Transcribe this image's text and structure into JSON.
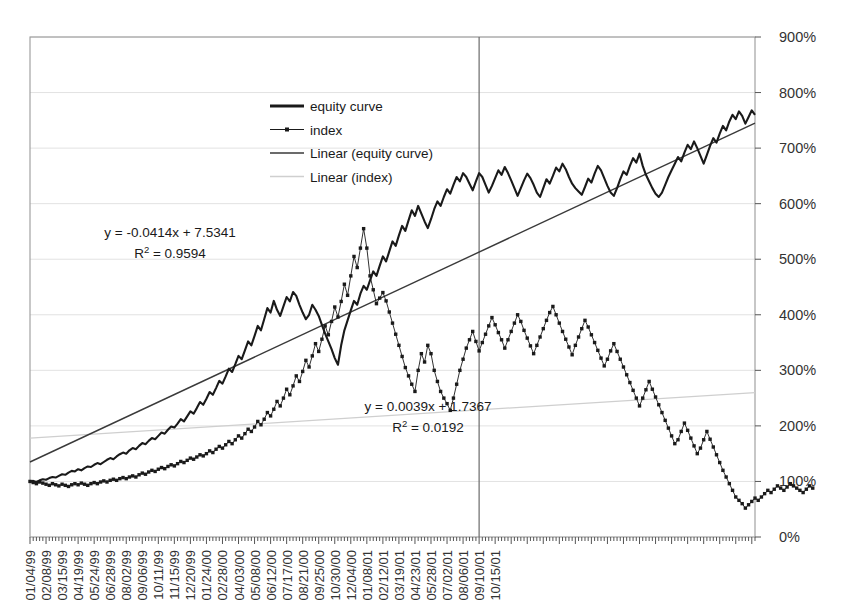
{
  "chart_data": {
    "type": "line",
    "title": "",
    "subtitle": "",
    "xlabel": "",
    "ylabel": "",
    "ylim": [
      0,
      900
    ],
    "y_tick_step": 100,
    "y_tick_labels": [
      "0%",
      "100%",
      "200%",
      "300%",
      "400%",
      "500%",
      "600%",
      "700%",
      "800%",
      "900%"
    ],
    "y_axis_position": "right",
    "grid": true,
    "grid_axis": "y",
    "legend_position": "top-center-left",
    "x_tick_labels": [
      "01/04/99",
      "02/08/99",
      "03/15/99",
      "04/19/99",
      "05/24/99",
      "06/28/99",
      "08/02/99",
      "09/06/99",
      "10/11/99",
      "11/15/99",
      "12/20/99",
      "01/24/00",
      "02/28/00",
      "04/03/00",
      "05/08/00",
      "06/12/00",
      "07/17/00",
      "08/21/00",
      "09/25/00",
      "10/30/00",
      "12/04/00",
      "01/08/01",
      "02/12/01",
      "03/19/01",
      "04/23/01",
      "05/28/01",
      "07/02/01",
      "08/06/01",
      "09/10/01",
      "10/15/01"
    ],
    "x_tick_label_interval_weeks": 5,
    "x_label_rotation": -90,
    "annotations": [
      {
        "name": "equity-trendline-equation",
        "lines": [
          "y = -0.0414x + 7.5341",
          "R2 = 0.9594"
        ],
        "line1": "y = -0.0414x + 7.5341",
        "r2_prefix": "R",
        "r2_sup": "2",
        "r2_value": " = 0.9594"
      },
      {
        "name": "index-trendline-equation",
        "lines": [
          "y = 0.0039x + 1.7367",
          "R2 = 0.0192"
        ],
        "line1": "y = 0.0039x + 1.7367",
        "r2_prefix": "R",
        "r2_sup": "2",
        "r2_value": " = 0.0192"
      }
    ],
    "vertical_marker": {
      "label": "09/10/01",
      "week_index": 140
    },
    "series": [
      {
        "name": "equity curve",
        "style": "thick-line-no-marker",
        "color": "#1a1a1a",
        "values": [
          100,
          101,
          99,
          102,
          104,
          103,
          106,
          108,
          107,
          110,
          113,
          112,
          116,
          119,
          118,
          122,
          120,
          124,
          127,
          126,
          130,
          133,
          131,
          135,
          139,
          142,
          140,
          145,
          149,
          152,
          150,
          156,
          160,
          158,
          164,
          169,
          167,
          173,
          178,
          176,
          182,
          188,
          186,
          193,
          199,
          197,
          204,
          212,
          208,
          217,
          226,
          222,
          232,
          243,
          238,
          249,
          261,
          256,
          268,
          281,
          276,
          289,
          303,
          297,
          311,
          326,
          320,
          336,
          352,
          345,
          362,
          380,
          372,
          392,
          412,
          404,
          425,
          409,
          398,
          415,
          432,
          424,
          441,
          434,
          418,
          404,
          392,
          400,
          418,
          409,
          398,
          382,
          366,
          352,
          338,
          322,
          310,
          345,
          372,
          390,
          408,
          425,
          418,
          438,
          452,
          445,
          462,
          478,
          470,
          488,
          505,
          496,
          514,
          532,
          524,
          543,
          560,
          551,
          570,
          588,
          578,
          596,
          582,
          568,
          556,
          572,
          590,
          604,
          596,
          612,
          626,
          618,
          634,
          648,
          640,
          655,
          648,
          636,
          624,
          640,
          655,
          648,
          634,
          620,
          632,
          646,
          660,
          652,
          666,
          655,
          642,
          628,
          614,
          628,
          642,
          654,
          646,
          634,
          620,
          612,
          628,
          644,
          636,
          650,
          665,
          658,
          672,
          662,
          648,
          636,
          628,
          622,
          616,
          630,
          645,
          638,
          654,
          668,
          660,
          646,
          632,
          620,
          614,
          628,
          644,
          658,
          652,
          668,
          682,
          674,
          690,
          668,
          652,
          640,
          628,
          618,
          612,
          620,
          634,
          648,
          660,
          672,
          684,
          676,
          692,
          706,
          698,
          712,
          700,
          686,
          672,
          688,
          704,
          718,
          710,
          726,
          740,
          732,
          748,
          760,
          752,
          766,
          758,
          744,
          756,
          768,
          760
        ]
      },
      {
        "name": "index",
        "style": "thin-line-with-marker",
        "color": "#1a1a1a",
        "values": [
          100,
          98,
          96,
          99,
          97,
          95,
          93,
          96,
          94,
          92,
          95,
          93,
          91,
          94,
          96,
          94,
          97,
          95,
          93,
          96,
          98,
          96,
          99,
          101,
          99,
          102,
          104,
          102,
          105,
          107,
          105,
          108,
          110,
          108,
          112,
          115,
          113,
          117,
          120,
          118,
          122,
          125,
          123,
          127,
          130,
          128,
          132,
          136,
          134,
          138,
          142,
          140,
          144,
          148,
          146,
          150,
          155,
          152,
          158,
          163,
          160,
          166,
          172,
          168,
          175,
          182,
          178,
          186,
          194,
          190,
          198,
          208,
          202,
          212,
          224,
          218,
          230,
          244,
          236,
          250,
          266,
          256,
          272,
          290,
          280,
          298,
          318,
          306,
          326,
          348,
          334,
          356,
          380,
          364,
          388,
          414,
          396,
          424,
          455,
          435,
          470,
          505,
          485,
          520,
          555,
          520,
          470,
          445,
          420,
          430,
          440,
          425,
          405,
          385,
          365,
          345,
          325,
          305,
          290,
          275,
          262,
          300,
          330,
          315,
          345,
          330,
          300,
          280,
          262,
          250,
          240,
          228,
          250,
          275,
          300,
          320,
          340,
          355,
          370,
          352,
          335,
          350,
          365,
          380,
          395,
          382,
          368,
          355,
          340,
          355,
          370,
          385,
          400,
          388,
          372,
          358,
          344,
          330,
          345,
          360,
          375,
          390,
          404,
          415,
          400,
          385,
          370,
          356,
          342,
          328,
          345,
          360,
          375,
          390,
          378,
          364,
          350,
          336,
          322,
          308,
          320,
          335,
          348,
          334,
          320,
          306,
          292,
          278,
          264,
          250,
          236,
          250,
          265,
          280,
          266,
          252,
          238,
          224,
          210,
          196,
          182,
          168,
          175,
          190,
          205,
          192,
          178,
          164,
          150,
          160,
          175,
          190,
          176,
          162,
          148,
          134,
          120,
          108,
          96,
          84,
          72,
          66,
          60,
          52,
          58,
          64,
          70,
          66,
          72,
          78,
          84,
          80,
          86,
          92,
          88,
          84,
          90,
          96,
          92,
          88,
          84,
          80,
          86,
          92,
          88
        ]
      }
    ],
    "trendlines": [
      {
        "name": "Linear (equity curve)",
        "for": "equity curve",
        "color": "#3a3a3a",
        "start_value": 135,
        "end_value": 745,
        "equation": "y = -0.0414x + 7.5341",
        "r_squared": 0.9594
      },
      {
        "name": "Linear (index)",
        "for": "index",
        "color": "#cfcfcf",
        "start_value": 178,
        "end_value": 260,
        "equation": "y = 0.0039x + 1.7367",
        "r_squared": 0.0192
      }
    ],
    "legend": [
      {
        "label": "equity curve",
        "type": "thick-line",
        "color": "#1a1a1a"
      },
      {
        "label": "index",
        "type": "thin-line-marker",
        "color": "#1a1a1a"
      },
      {
        "label": "Linear (equity curve)",
        "type": "line",
        "color": "#3a3a3a"
      },
      {
        "label": "Linear (index)",
        "type": "line",
        "color": "#cfcfcf"
      }
    ]
  }
}
